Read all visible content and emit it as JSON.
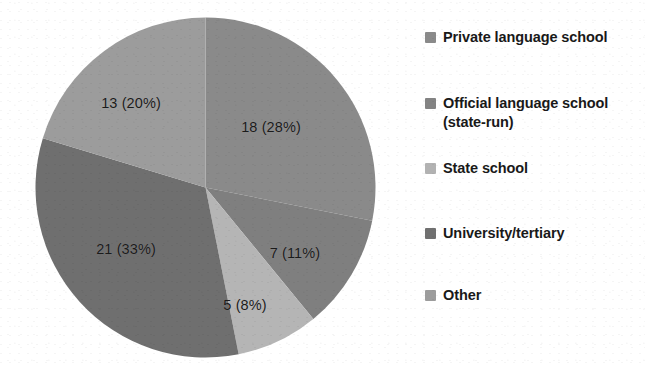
{
  "chart_data": {
    "type": "pie",
    "title": "",
    "legend_position": "right",
    "categories": [
      "Private language school",
      "Official language school (state-run)",
      "State school",
      "University/tertiary",
      "Other"
    ],
    "values": [
      18,
      7,
      5,
      21,
      13
    ],
    "percentages": [
      28,
      11,
      8,
      33,
      20
    ],
    "total": 64,
    "data_labels": [
      "18 (28%)",
      "7 (11%)",
      "5 (8%)",
      "21 (33%)",
      "13 (20%)"
    ],
    "colors": [
      "#8a8a8a",
      "#7f7f7f",
      "#b5b5b5",
      "#6f6f6f",
      "#9c9c9c"
    ],
    "start_angle_deg": 0,
    "direction": "clockwise"
  },
  "pie": {
    "slices": [
      {
        "label": "18 (28%)",
        "name": "private-language-school",
        "value": 18,
        "percent": 28,
        "color": "#8a8a8a"
      },
      {
        "label": "7 (11%)",
        "name": "official-language-school",
        "value": 7,
        "percent": 11,
        "color": "#7f7f7f"
      },
      {
        "label": "5 (8%)",
        "name": "state-school",
        "value": 5,
        "percent": 8,
        "color": "#b5b5b5"
      },
      {
        "label": "21 (33%)",
        "name": "university-tertiary",
        "value": 21,
        "percent": 33,
        "color": "#6f6f6f"
      },
      {
        "label": "13 (20%)",
        "name": "other",
        "value": 13,
        "percent": 20,
        "color": "#9c9c9c"
      }
    ]
  },
  "legend": {
    "items": [
      {
        "label": "Private language school",
        "color": "#8a8a8a"
      },
      {
        "label": "Official language school (state-run)",
        "color": "#838383"
      },
      {
        "label": "State school",
        "color": "#b2b2b2"
      },
      {
        "label": "University/tertiary",
        "color": "#707070"
      },
      {
        "label": "Other",
        "color": "#9c9c9c"
      }
    ]
  }
}
